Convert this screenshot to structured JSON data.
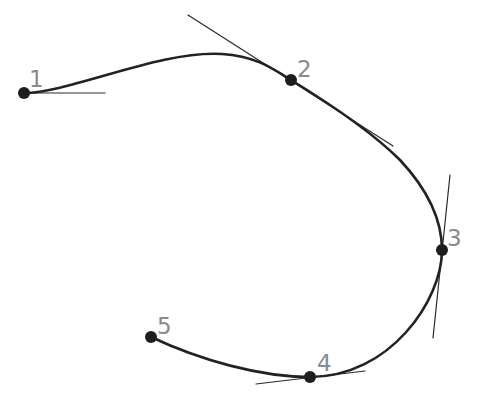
{
  "diagram": {
    "title": "",
    "colors": {
      "background": "#ffffff",
      "curve": "#222222",
      "tangent": "#2a2a2a",
      "point": "#1e1e1e",
      "label": "#8a8a8a"
    },
    "points": [
      {
        "id": 1,
        "label": "1",
        "x": 24,
        "y": 93,
        "label_x": 29,
        "label_y": 87
      },
      {
        "id": 2,
        "label": "2",
        "x": 291,
        "y": 80,
        "label_x": 297,
        "label_y": 77
      },
      {
        "id": 3,
        "label": "3",
        "x": 442,
        "y": 250,
        "label_x": 447,
        "label_y": 246
      },
      {
        "id": 4,
        "label": "4",
        "x": 310,
        "y": 377,
        "label_x": 317,
        "label_y": 371
      },
      {
        "id": 5,
        "label": "5",
        "x": 151,
        "y": 337,
        "label_x": 157,
        "label_y": 334
      }
    ],
    "tangents": [
      {
        "at_point": 1,
        "x1": 24,
        "y1": 93,
        "x2": 105,
        "y2": 93
      },
      {
        "at_point": 2,
        "x1": 188,
        "y1": 15,
        "x2": 393,
        "y2": 146
      },
      {
        "at_point": 3,
        "x1": 450,
        "y1": 175,
        "x2": 433,
        "y2": 338
      },
      {
        "at_point": 4,
        "x1": 256,
        "y1": 384,
        "x2": 365,
        "y2": 371
      }
    ],
    "curve_path": "M 24 93 C 70 93, 160 50, 222 54 C 255 56, 272 68, 291 80 C 340 110, 375 135, 400 160 C 428 190, 442 220, 442 250 C 442 300, 390 377, 310 377 C 260 377, 200 360, 151 337"
  }
}
